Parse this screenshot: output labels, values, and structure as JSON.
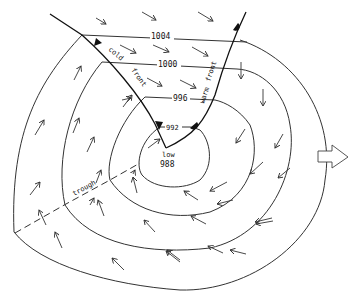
{
  "diagram": {
    "isobars": [
      {
        "label": "1004",
        "value": 1004
      },
      {
        "label": "1000",
        "value": 1000
      },
      {
        "label": "996",
        "value": 996
      },
      {
        "label": "992",
        "value": 992
      }
    ],
    "center": {
      "label_line1": "low",
      "label_line2": "988"
    },
    "fronts": {
      "cold": {
        "label_1": "cold",
        "label_2": "front"
      },
      "warm": {
        "label_1": "warm",
        "label_2": "front"
      }
    },
    "trough": {
      "label": "trough"
    },
    "direction_arrow": "right-arrow"
  }
}
